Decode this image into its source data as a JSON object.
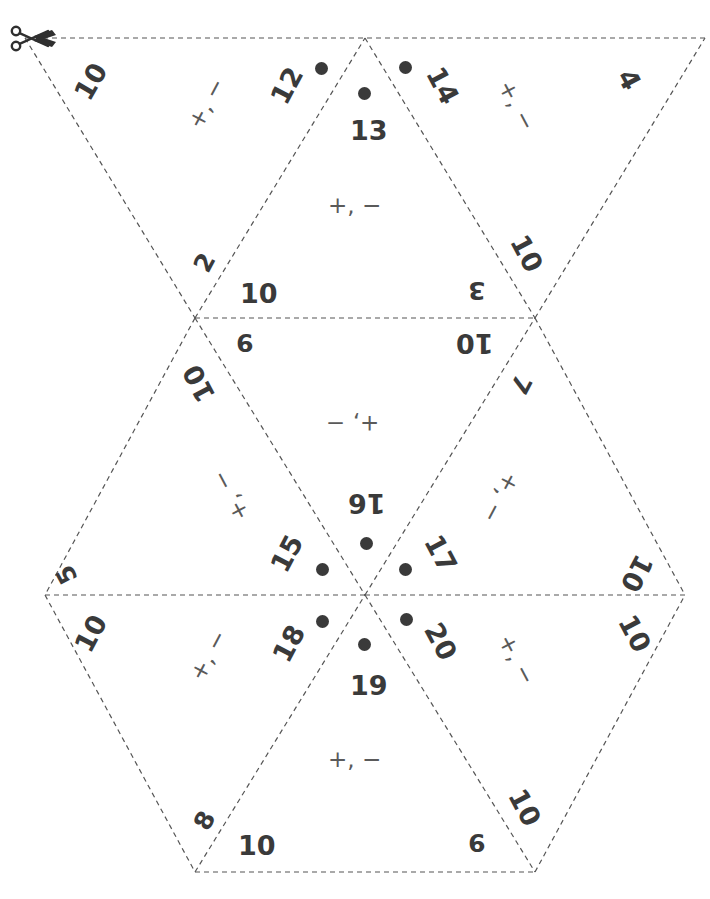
{
  "document": {
    "kind": "flexagon-cut-out-template",
    "title": "Hexaflexagon strip template",
    "cut_icon": "scissors-icon",
    "stroke_color": "#555555",
    "text_color": "#3a3a3a",
    "operator_color": "#5a5a5a",
    "background": "#ffffff"
  },
  "faces": [
    {
      "id": "face-t1",
      "position": "top-left",
      "edge_labels": [
        "10",
        "2"
      ],
      "operators": "+, −",
      "number": null,
      "dot": false
    },
    {
      "id": "face-t2",
      "position": "top-inner-left",
      "edge_labels": [
        "12"
      ],
      "operators": null,
      "number": "12",
      "dot": true
    },
    {
      "id": "face-t3",
      "position": "top-center",
      "edge_labels": [
        "10",
        "3"
      ],
      "operators": "+, −",
      "number": "13",
      "dot": true
    },
    {
      "id": "face-t4",
      "position": "top-inner-right",
      "edge_labels": [
        "14"
      ],
      "operators": null,
      "number": "14",
      "dot": true
    },
    {
      "id": "face-t5",
      "position": "top-right",
      "edge_labels": [
        "4",
        "10"
      ],
      "operators": "+, −",
      "number": null,
      "dot": false
    },
    {
      "id": "face-m1",
      "position": "middle-center",
      "edge_labels": [
        "9",
        "10"
      ],
      "operators": "+, −",
      "number": null,
      "dot": false
    },
    {
      "id": "face-m2",
      "position": "middle-left",
      "edge_labels": [
        "10",
        "5"
      ],
      "operators": "+, −",
      "number": "15",
      "dot": true
    },
    {
      "id": "face-m3",
      "position": "middle-top",
      "edge_labels": [],
      "operators": null,
      "number": "16",
      "dot": true
    },
    {
      "id": "face-m4",
      "position": "middle-right",
      "edge_labels": [
        "7",
        "10"
      ],
      "operators": "+, −",
      "number": "17",
      "dot": true
    },
    {
      "id": "face-b1",
      "position": "bottom-left",
      "edge_labels": [
        "10",
        "8"
      ],
      "operators": "+, −",
      "number": "18",
      "dot": true
    },
    {
      "id": "face-b2",
      "position": "bottom-center",
      "edge_labels": [
        "10",
        "9"
      ],
      "operators": "+, −",
      "number": "19",
      "dot": true
    },
    {
      "id": "face-b3",
      "position": "bottom-right",
      "edge_labels": [
        "10",
        "10"
      ],
      "operators": "+, −",
      "number": "20",
      "dot": true
    }
  ],
  "labels": {
    "top_left_10": "10",
    "top_left_2": "2",
    "top_mid_10": "10",
    "top_12": "12",
    "top_13": "13",
    "top_14": "14",
    "top_3": "3",
    "top_right_10": "10",
    "top_right_4": "4",
    "mid_9": "9",
    "mid_left_10": "10",
    "mid_right_10": "10",
    "mid_7": "7",
    "mid_15": "15",
    "mid_16": "16",
    "mid_17": "17",
    "left_5": "5",
    "left_10": "10",
    "right_10_upper": "10",
    "right_10_lower": "10",
    "bot_18": "18",
    "bot_19": "19",
    "bot_20": "20",
    "bot_8": "8",
    "bot_10": "10",
    "bot_9": "9",
    "bot_right_10": "10"
  },
  "operators": {
    "tl": "+, −",
    "tc": "+, −",
    "tr": "+, −",
    "mc": "+, −",
    "ml": "+, −",
    "mr": "+, −",
    "bl": "+, −",
    "bc": "+, −",
    "br": "+, −"
  }
}
